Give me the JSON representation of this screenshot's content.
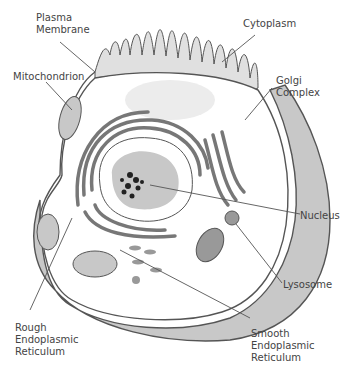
{
  "diagram": {
    "labels": [
      {
        "id": "plasma-membrane",
        "text": "Plasma\nMembrane"
      },
      {
        "id": "mitochondrion",
        "text": "Mitochondrion"
      },
      {
        "id": "cytoplasm",
        "text": "Cytoplasm"
      },
      {
        "id": "golgi-complex",
        "text": "Golgi\nComplex"
      },
      {
        "id": "nucleus",
        "text": "Nucleus"
      },
      {
        "id": "lysosome",
        "text": "Lysosome"
      },
      {
        "id": "rough-er",
        "text": "Rough\nEndoplasmic\nReticulum"
      },
      {
        "id": "smooth-er",
        "text": "Smooth\nEndoplasmic\nReticulum"
      }
    ],
    "colors": {
      "outline": "#555555",
      "fill_gray": "#c8c8c8",
      "fill_light": "#e6e6e6",
      "chromatin": "#222222",
      "text": "#444444"
    }
  }
}
